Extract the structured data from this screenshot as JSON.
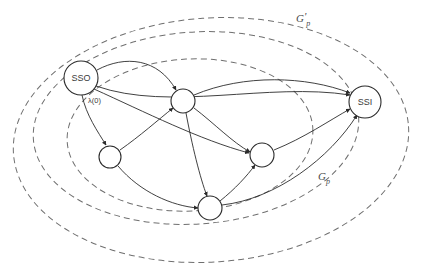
{
  "diagram": {
    "canvas": {
      "width": 423,
      "height": 277,
      "background": "#ffffff"
    },
    "colors": {
      "node_stroke": "#2b2b2b",
      "node_fill": "#ffffff",
      "edge_stroke": "#2b2b2b",
      "region_stroke": "#6f6f6f",
      "text": "#3a3a3a"
    },
    "nodes": [
      {
        "id": "sso",
        "label": "SSO",
        "cx": 81,
        "cy": 78,
        "r": 17,
        "labeled": true
      },
      {
        "id": "n1",
        "label": "",
        "cx": 183,
        "cy": 101,
        "r": 12,
        "labeled": false
      },
      {
        "id": "n2",
        "label": "",
        "cx": 110,
        "cy": 157,
        "r": 11,
        "labeled": false
      },
      {
        "id": "n3",
        "label": "",
        "cx": 262,
        "cy": 155,
        "r": 12,
        "labeled": false
      },
      {
        "id": "n4",
        "label": "",
        "cx": 210,
        "cy": 208,
        "r": 12,
        "labeled": false
      },
      {
        "id": "ssi",
        "label": "SSI",
        "cx": 365,
        "cy": 102,
        "r": 16,
        "labeled": true
      }
    ],
    "edges": [
      {
        "from": "sso",
        "to": "n1",
        "label": "",
        "arrow": true
      },
      {
        "from": "sso",
        "to": "n2",
        "label": "λ(0)",
        "arrow": true
      },
      {
        "from": "sso",
        "to": "n3",
        "label": "",
        "arrow": true
      },
      {
        "from": "sso",
        "to": "ssi",
        "label": "",
        "arrow": true
      },
      {
        "from": "n2",
        "to": "n1",
        "label": "",
        "arrow": true
      },
      {
        "from": "n2",
        "to": "n4",
        "label": "",
        "arrow": true
      },
      {
        "from": "n1",
        "to": "n3",
        "label": "",
        "arrow": true
      },
      {
        "from": "n1",
        "to": "n4",
        "label": "",
        "arrow": true
      },
      {
        "from": "n1",
        "to": "ssi",
        "label": "",
        "arrow": true
      },
      {
        "from": "n4",
        "to": "n3",
        "label": "",
        "arrow": true
      },
      {
        "from": "n4",
        "to": "ssi",
        "label": "",
        "arrow": true
      },
      {
        "from": "n3",
        "to": "ssi",
        "label": "",
        "arrow": true
      }
    ],
    "regions": [
      {
        "id": "g-prime-p",
        "label_main": "G",
        "label_prime": "'",
        "label_sub": "p",
        "label_x": 296,
        "label_y": 22,
        "cx": 211,
        "cy": 140,
        "rx": 198,
        "ry": 122,
        "rotate": -4
      },
      {
        "id": "g-p",
        "label_main": "G",
        "label_prime": "",
        "label_sub": "p",
        "label_x": 318,
        "label_y": 180,
        "cx": 196,
        "cy": 128,
        "rx": 163,
        "ry": 96,
        "rotate": -4
      },
      {
        "id": "g-p-inner",
        "label_main": "",
        "label_prime": "",
        "label_sub": "",
        "label_x": 0,
        "label_y": 0,
        "cx": 190,
        "cy": 135,
        "rx": 123,
        "ry": 76,
        "rotate": -3
      }
    ],
    "edge_labels": [
      {
        "id": "lambda-zero",
        "text": "λ(0)",
        "x": 88,
        "y": 103
      }
    ]
  }
}
